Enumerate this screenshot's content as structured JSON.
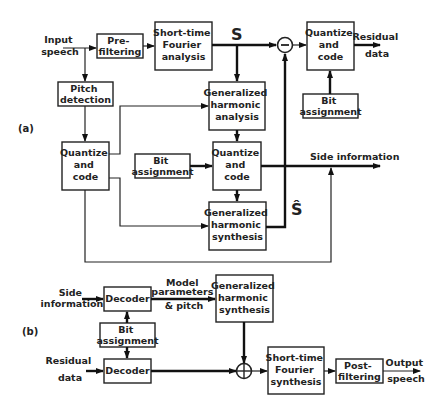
{
  "part_a": {
    "label": "(a)",
    "input": [
      "Input",
      "speech"
    ],
    "prefilter": [
      "Pre-",
      "filtering"
    ],
    "stft_analysis": [
      "Short-time",
      "Fourier",
      "analysis"
    ],
    "signal_s": "S",
    "signal_s_hat": "Ŝ",
    "subtract_symbol": "−",
    "quantize_residual": [
      "Quantize",
      "and",
      "code"
    ],
    "residual_out": [
      "Residual",
      "data"
    ],
    "bit_assign_residual": [
      "Bit",
      "assignment"
    ],
    "pitch_detection": [
      "Pitch",
      "detection"
    ],
    "gh_analysis": [
      "Generalized",
      "harmonic",
      "analysis"
    ],
    "quantize_pitch": [
      "Quantize",
      "and",
      "code"
    ],
    "bit_assign_model": [
      "Bit",
      "assignment"
    ],
    "quantize_model": [
      "Quantize",
      "and",
      "code"
    ],
    "side_info_out": "Side information",
    "gh_synthesis": [
      "Generalized",
      "harmonic",
      "synthesis"
    ]
  },
  "part_b": {
    "label": "(b)",
    "side_info_in": [
      "Side",
      "information"
    ],
    "decoder_top": "Decoder",
    "model_params": [
      "Model",
      "parameters",
      "& pitch"
    ],
    "gh_synthesis": [
      "Generalized",
      "harmonic",
      "synthesis"
    ],
    "bit_assign": [
      "Bit",
      "assignment"
    ],
    "residual_in": [
      "Residual",
      "data"
    ],
    "decoder_bottom": "Decoder",
    "stft_synthesis": [
      "Short-time",
      "Fourier",
      "synthesis"
    ],
    "postfilter": [
      "Post-",
      "filtering"
    ],
    "output": [
      "Output",
      "speech"
    ]
  }
}
